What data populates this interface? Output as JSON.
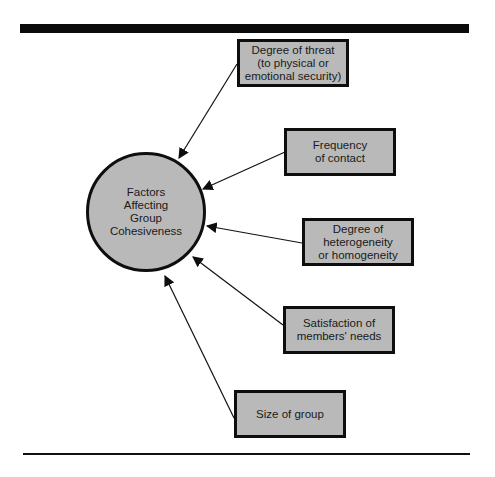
{
  "diagram": {
    "center": {
      "label": "Factors\nAffecting\nGroup\nCohesiveness"
    },
    "factors": [
      {
        "label": "Degree of threat\n(to physical or\nemotional security)"
      },
      {
        "label": "Frequency\nof contact"
      },
      {
        "label": "Degree of\nheterogeneity\nor homogeneity"
      },
      {
        "label": "Satisfaction of\nmembers' needs"
      },
      {
        "label": "Size of group"
      }
    ],
    "edges": [
      {
        "from": "factors.0",
        "to": "center"
      },
      {
        "from": "factors.1",
        "to": "center"
      },
      {
        "from": "factors.2",
        "to": "center"
      },
      {
        "from": "factors.3",
        "to": "center"
      },
      {
        "from": "factors.4",
        "to": "center"
      }
    ],
    "colors": {
      "fill": "#b9b9b9",
      "stroke": "#0e0e0e",
      "text": "#1a1a1a",
      "background": "#ffffff"
    }
  }
}
